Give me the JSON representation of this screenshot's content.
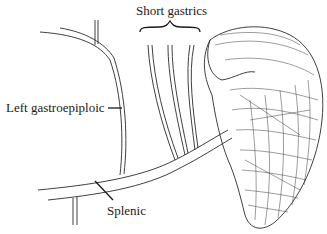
{
  "figure": {
    "labels": {
      "short_gastrics": "Short gastrics",
      "left_gastroepiploic": "Left gastroepiploic",
      "splenic": "Splenic"
    },
    "colors": {
      "ink": "#1a1a1a",
      "background": "#ffffff"
    }
  }
}
